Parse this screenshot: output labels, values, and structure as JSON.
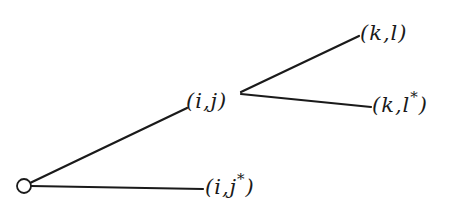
{
  "diagram": {
    "type": "tree",
    "root": {
      "shape": "open-circle"
    },
    "nodes": [
      {
        "id": "ij",
        "label_pre": "(i,j",
        "label_star": "",
        "label_post": ")"
      },
      {
        "id": "ijstar",
        "label_pre": "(i,j",
        "label_star": "*",
        "label_post": ")"
      },
      {
        "id": "kl",
        "label_pre": "(k,l",
        "label_star": "",
        "label_post": ")"
      },
      {
        "id": "klstar",
        "label_pre": "(k,l",
        "label_star": "*",
        "label_post": ")"
      }
    ],
    "edges": [
      {
        "from": "root",
        "to": "(i,j)"
      },
      {
        "from": "root",
        "to": "(i,j*)"
      },
      {
        "from": "(i,j)",
        "to": "(k,l)"
      },
      {
        "from": "(i,j)",
        "to": "(k,l*)"
      }
    ],
    "colors": {
      "ink": "#1a1a1a",
      "background": "#ffffff"
    }
  }
}
